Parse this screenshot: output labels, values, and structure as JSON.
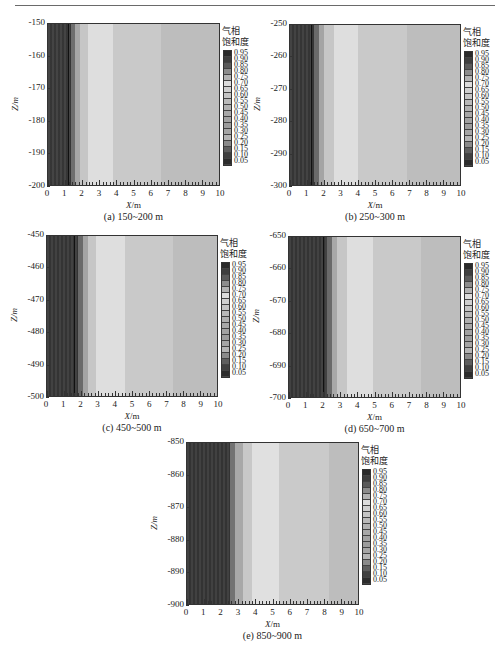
{
  "figure": {
    "colorbar_title_line1": "气相",
    "colorbar_title_line2": "饱和度",
    "colorbar_levels": [
      "0.95",
      "0.90",
      "0.85",
      "0.80",
      "0.75",
      "0.70",
      "0.65",
      "0.60",
      "0.55",
      "0.50",
      "0.45",
      "0.40",
      "0.35",
      "0.30",
      "0.25",
      "0.20",
      "0.15",
      "0.10",
      "0.05"
    ],
    "colorbar_colors": [
      "#2a2a2a",
      "#3e3e3e",
      "#5a5a5a",
      "#8c8c8c",
      "#b2b2b2",
      "#dcdcdc",
      "#cfcfcf",
      "#c4c4c4",
      "#b9b9b9",
      "#b0b0b0",
      "#a8a8a8",
      "#a2a2a2",
      "#9c9c9c",
      "#a5a5a5",
      "#b4b4b4",
      "#8a8a8a",
      "#5e5e5e",
      "#404040",
      "#2c2c2c"
    ],
    "x_label_var": "X",
    "x_label_unit": "/m",
    "y_label": "Z/m",
    "x_ticks": [
      "0",
      "1",
      "2",
      "3",
      "4",
      "5",
      "6",
      "7",
      "8",
      "9",
      "10"
    ]
  },
  "panels": [
    {
      "caption": "(a) 150~200 m",
      "y_ticks": [
        "-150",
        "-160",
        "-170",
        "-180",
        "-190",
        "-200"
      ],
      "bands": [
        {
          "x0": 0,
          "x1": 1.35,
          "color": "#3a3a3a"
        },
        {
          "x0": 1.35,
          "x1": 1.55,
          "color": "#6e6e6e"
        },
        {
          "x0": 1.55,
          "x1": 1.85,
          "color": "#a6a6a6"
        },
        {
          "x0": 1.85,
          "x1": 2.35,
          "color": "#c6c6c6"
        },
        {
          "x0": 2.35,
          "x1": 3.8,
          "color": "#dedede"
        },
        {
          "x0": 3.8,
          "x1": 6.6,
          "color": "#c9c9c9"
        },
        {
          "x0": 6.6,
          "x1": 10,
          "color": "#bdbdbd"
        }
      ],
      "contour_x": 1.15
    },
    {
      "caption": "(b) 250~300 m",
      "y_ticks": [
        "-250",
        "-260",
        "-270",
        "-280",
        "-290",
        "-300"
      ],
      "bands": [
        {
          "x0": 0,
          "x1": 1.4,
          "color": "#393939"
        },
        {
          "x0": 1.4,
          "x1": 1.7,
          "color": "#6a6a6a"
        },
        {
          "x0": 1.7,
          "x1": 2.0,
          "color": "#a4a4a4"
        },
        {
          "x0": 2.0,
          "x1": 2.6,
          "color": "#c6c6c6"
        },
        {
          "x0": 2.6,
          "x1": 4.0,
          "color": "#dedede"
        },
        {
          "x0": 4.0,
          "x1": 6.9,
          "color": "#c9c9c9"
        },
        {
          "x0": 6.9,
          "x1": 10,
          "color": "#bdbdbd"
        }
      ],
      "contour_x": 1.25
    },
    {
      "caption": "(c) 450~500 m",
      "y_ticks": [
        "-450",
        "-460",
        "-470",
        "-480",
        "-490",
        "-500"
      ],
      "bands": [
        {
          "x0": 0,
          "x1": 1.8,
          "color": "#383838"
        },
        {
          "x0": 1.8,
          "x1": 2.1,
          "color": "#6a6a6a"
        },
        {
          "x0": 2.1,
          "x1": 2.4,
          "color": "#a4a4a4"
        },
        {
          "x0": 2.4,
          "x1": 2.9,
          "color": "#c6c6c6"
        },
        {
          "x0": 2.9,
          "x1": 4.6,
          "color": "#dedede"
        },
        {
          "x0": 4.6,
          "x1": 7.4,
          "color": "#c9c9c9"
        },
        {
          "x0": 7.4,
          "x1": 10,
          "color": "#bdbdbd"
        }
      ],
      "contour_x": 1.6
    },
    {
      "caption": "(d) 650~700 m",
      "y_ticks": [
        "-650",
        "-660",
        "-670",
        "-680",
        "-690",
        "-700"
      ],
      "bands": [
        {
          "x0": 0,
          "x1": 2.2,
          "color": "#383838"
        },
        {
          "x0": 2.2,
          "x1": 2.5,
          "color": "#6a6a6a"
        },
        {
          "x0": 2.5,
          "x1": 2.8,
          "color": "#a8a8a8"
        },
        {
          "x0": 2.8,
          "x1": 3.4,
          "color": "#c6c6c6"
        },
        {
          "x0": 3.4,
          "x1": 4.9,
          "color": "#dedede"
        },
        {
          "x0": 4.9,
          "x1": 7.7,
          "color": "#c9c9c9"
        },
        {
          "x0": 7.7,
          "x1": 10,
          "color": "#bdbdbd"
        }
      ],
      "contour_x": 2.0
    },
    {
      "caption": "(e) 850~900 m",
      "y_ticks": [
        "-850",
        "-860",
        "-870",
        "-880",
        "-890",
        "-900"
      ],
      "bands": [
        {
          "x0": 0,
          "x1": 2.5,
          "color": "#373737"
        },
        {
          "x0": 2.5,
          "x1": 2.8,
          "color": "#727272"
        },
        {
          "x0": 2.8,
          "x1": 3.3,
          "color": "#a8a8a8"
        },
        {
          "x0": 3.3,
          "x1": 3.8,
          "color": "#c8c8c8"
        },
        {
          "x0": 3.8,
          "x1": 5.4,
          "color": "#e0e0e0"
        },
        {
          "x0": 5.4,
          "x1": 8.3,
          "color": "#cacaca"
        },
        {
          "x0": 8.3,
          "x1": 10,
          "color": "#bdbdbd"
        }
      ],
      "contour_x": null
    }
  ],
  "chart_data": [
    {
      "type": "heatmap",
      "title": "(a) 150~200 m",
      "xlabel": "X/m",
      "ylabel": "Z/m",
      "xlim": [
        0,
        10
      ],
      "ylim": [
        -200,
        -150
      ],
      "x_ticks": [
        0,
        1,
        2,
        3,
        4,
        5,
        6,
        7,
        8,
        9,
        10
      ],
      "y_ticks": [
        -150,
        -160,
        -170,
        -180,
        -190,
        -200
      ],
      "legend_title": "气相饱和度",
      "legend_levels": [
        0.95,
        0.9,
        0.85,
        0.8,
        0.75,
        0.7,
        0.65,
        0.6,
        0.55,
        0.5,
        0.45,
        0.4,
        0.35,
        0.3,
        0.25,
        0.2,
        0.15,
        0.1,
        0.05
      ],
      "zones_by_x": [
        {
          "x_range": [
            0,
            1.35
          ],
          "gas_saturation_approx": 0.05
        },
        {
          "x_range": [
            1.35,
            2.35
          ],
          "gas_saturation_approx": "transition 0.10-0.75"
        },
        {
          "x_range": [
            2.35,
            3.8
          ],
          "gas_saturation_approx": 0.7
        },
        {
          "x_range": [
            3.8,
            6.6
          ],
          "gas_saturation_approx": 0.6
        },
        {
          "x_range": [
            6.6,
            10
          ],
          "gas_saturation_approx": 0.55
        }
      ]
    },
    {
      "type": "heatmap",
      "title": "(b) 250~300 m",
      "xlabel": "X/m",
      "ylabel": "Z/m",
      "xlim": [
        0,
        10
      ],
      "ylim": [
        -300,
        -250
      ],
      "x_ticks": [
        0,
        1,
        2,
        3,
        4,
        5,
        6,
        7,
        8,
        9,
        10
      ],
      "y_ticks": [
        -250,
        -260,
        -270,
        -280,
        -290,
        -300
      ],
      "legend_title": "气相饱和度",
      "legend_levels": [
        0.95,
        0.9,
        0.85,
        0.8,
        0.75,
        0.7,
        0.65,
        0.6,
        0.55,
        0.5,
        0.45,
        0.4,
        0.35,
        0.3,
        0.25,
        0.2,
        0.15,
        0.1,
        0.05
      ],
      "zones_by_x": [
        {
          "x_range": [
            0,
            1.4
          ],
          "gas_saturation_approx": 0.05
        },
        {
          "x_range": [
            1.4,
            2.6
          ],
          "gas_saturation_approx": "transition 0.10-0.75"
        },
        {
          "x_range": [
            2.6,
            4.0
          ],
          "gas_saturation_approx": 0.7
        },
        {
          "x_range": [
            4.0,
            6.9
          ],
          "gas_saturation_approx": 0.6
        },
        {
          "x_range": [
            6.9,
            10
          ],
          "gas_saturation_approx": 0.55
        }
      ]
    },
    {
      "type": "heatmap",
      "title": "(c) 450~500 m",
      "xlabel": "X/m",
      "ylabel": "Z/m",
      "xlim": [
        0,
        10
      ],
      "ylim": [
        -500,
        -450
      ],
      "x_ticks": [
        0,
        1,
        2,
        3,
        4,
        5,
        6,
        7,
        8,
        9,
        10
      ],
      "y_ticks": [
        -450,
        -460,
        -470,
        -480,
        -490,
        -500
      ],
      "legend_title": "气相饱和度",
      "legend_levels": [
        0.95,
        0.9,
        0.85,
        0.8,
        0.75,
        0.7,
        0.65,
        0.6,
        0.55,
        0.5,
        0.45,
        0.4,
        0.35,
        0.3,
        0.25,
        0.2,
        0.15,
        0.1,
        0.05
      ],
      "zones_by_x": [
        {
          "x_range": [
            0,
            1.8
          ],
          "gas_saturation_approx": 0.05
        },
        {
          "x_range": [
            1.8,
            2.9
          ],
          "gas_saturation_approx": "transition 0.10-0.75"
        },
        {
          "x_range": [
            2.9,
            4.6
          ],
          "gas_saturation_approx": 0.7
        },
        {
          "x_range": [
            4.6,
            7.4
          ],
          "gas_saturation_approx": 0.6
        },
        {
          "x_range": [
            7.4,
            10
          ],
          "gas_saturation_approx": 0.55
        }
      ]
    },
    {
      "type": "heatmap",
      "title": "(d) 650~700 m",
      "xlabel": "X/m",
      "ylabel": "Z/m",
      "xlim": [
        0,
        10
      ],
      "ylim": [
        -700,
        -650
      ],
      "x_ticks": [
        0,
        1,
        2,
        3,
        4,
        5,
        6,
        7,
        8,
        9,
        10
      ],
      "y_ticks": [
        -650,
        -660,
        -670,
        -680,
        -690,
        -700
      ],
      "legend_title": "气相饱和度",
      "legend_levels": [
        0.95,
        0.9,
        0.85,
        0.8,
        0.75,
        0.7,
        0.65,
        0.6,
        0.55,
        0.5,
        0.45,
        0.4,
        0.35,
        0.3,
        0.25,
        0.2,
        0.15,
        0.1,
        0.05
      ],
      "zones_by_x": [
        {
          "x_range": [
            0,
            2.2
          ],
          "gas_saturation_approx": 0.05
        },
        {
          "x_range": [
            2.2,
            3.4
          ],
          "gas_saturation_approx": "transition 0.10-0.75"
        },
        {
          "x_range": [
            3.4,
            4.9
          ],
          "gas_saturation_approx": 0.7
        },
        {
          "x_range": [
            4.9,
            7.7
          ],
          "gas_saturation_approx": 0.6
        },
        {
          "x_range": [
            7.7,
            10
          ],
          "gas_saturation_approx": 0.55
        }
      ]
    },
    {
      "type": "heatmap",
      "title": "(e) 850~900 m",
      "xlabel": "X/m",
      "ylabel": "Z/m",
      "xlim": [
        0,
        10
      ],
      "ylim": [
        -900,
        -850
      ],
      "x_ticks": [
        0,
        1,
        2,
        3,
        4,
        5,
        6,
        7,
        8,
        9,
        10
      ],
      "y_ticks": [
        -850,
        -860,
        -870,
        -880,
        -890,
        -900
      ],
      "legend_title": "气相饱和度",
      "legend_levels": [
        0.95,
        0.9,
        0.85,
        0.8,
        0.75,
        0.7,
        0.65,
        0.6,
        0.55,
        0.5,
        0.45,
        0.4,
        0.35,
        0.3,
        0.25,
        0.2,
        0.15,
        0.1,
        0.05
      ],
      "zones_by_x": [
        {
          "x_range": [
            0,
            2.5
          ],
          "gas_saturation_approx": 0.05
        },
        {
          "x_range": [
            2.5,
            3.8
          ],
          "gas_saturation_approx": "transition 0.10-0.75"
        },
        {
          "x_range": [
            3.8,
            5.4
          ],
          "gas_saturation_approx": 0.7
        },
        {
          "x_range": [
            5.4,
            8.3
          ],
          "gas_saturation_approx": 0.6
        },
        {
          "x_range": [
            8.3,
            10
          ],
          "gas_saturation_approx": 0.55
        }
      ]
    }
  ]
}
